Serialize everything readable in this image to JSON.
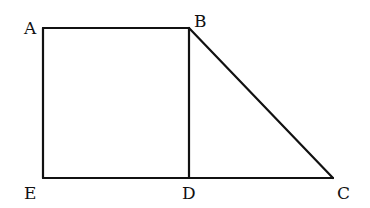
{
  "diagram": {
    "points": {
      "A": {
        "x": 43,
        "y": 28
      },
      "B": {
        "x": 189,
        "y": 28
      },
      "C": {
        "x": 333,
        "y": 178
      },
      "D": {
        "x": 189,
        "y": 178
      },
      "E": {
        "x": 43,
        "y": 178
      }
    },
    "labels": {
      "A": "A",
      "B": "B",
      "C": "C",
      "D": "D",
      "E": "E"
    },
    "segments": [
      "AB",
      "BD",
      "AE",
      "ED",
      "DC",
      "BC"
    ],
    "stroke_color": "#111111"
  }
}
